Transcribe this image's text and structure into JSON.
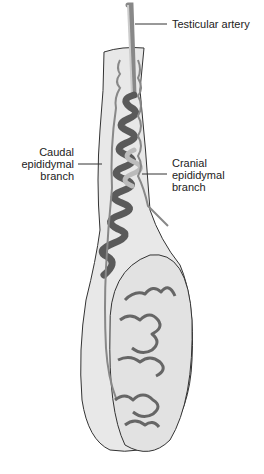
{
  "figure": {
    "labels": {
      "testicular_artery": "Testicular artery",
      "caudal": [
        "Caudal",
        "epididymal",
        "branch"
      ],
      "cranial": [
        "Cranial",
        "epididymal",
        "branch"
      ]
    },
    "colors": {
      "tissue": "#e4e4e4",
      "outline": "#333333",
      "vessel": "#777777",
      "duct_dark": "#555555",
      "duct_light": "#bbbbbb"
    }
  }
}
